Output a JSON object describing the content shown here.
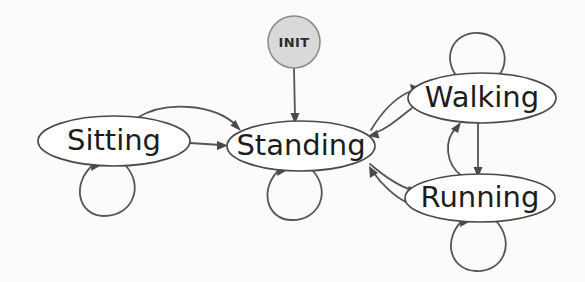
{
  "diagram": {
    "type": "state-machine-diagram",
    "canvas": {
      "width": 585,
      "height": 282
    },
    "colors": {
      "background": "#fbfbfa",
      "node_fill": "#ffffff",
      "node_stroke": "#4a4a4a",
      "init_fill": "#d9d9d9",
      "init_stroke": "#8a8a8a",
      "edge_stroke": "#555555",
      "label_text": "#1c1c1c"
    },
    "nodes": [
      {
        "id": "init",
        "label": "INIT",
        "shape": "circle",
        "filled": true,
        "cx": 294,
        "cy": 42,
        "rx": 26,
        "ry": 26
      },
      {
        "id": "sitting",
        "label": "Sitting",
        "shape": "ellipse",
        "filled": false,
        "cx": 114,
        "cy": 141,
        "rx": 76,
        "ry": 25
      },
      {
        "id": "standing",
        "label": "Standing",
        "shape": "ellipse",
        "filled": false,
        "cx": 301,
        "cy": 146,
        "rx": 74,
        "ry": 25
      },
      {
        "id": "walking",
        "label": "Walking",
        "shape": "ellipse",
        "filled": false,
        "cx": 482,
        "cy": 98,
        "rx": 74,
        "ry": 25
      },
      {
        "id": "running",
        "label": "Running",
        "shape": "ellipse",
        "filled": false,
        "cx": 480,
        "cy": 198,
        "rx": 75,
        "ry": 24
      }
    ],
    "edges": [
      {
        "id": "init-standing",
        "from": "init",
        "to": "standing",
        "style": "straight",
        "label": ""
      },
      {
        "id": "sitting-standing-arc",
        "from": "sitting",
        "to": "standing",
        "style": "curved",
        "label": ""
      },
      {
        "id": "sitting-standing-line",
        "from": "sitting",
        "to": "standing",
        "style": "straight",
        "label": ""
      },
      {
        "id": "standing-walking",
        "from": "standing",
        "to": "walking",
        "style": "curved",
        "label": ""
      },
      {
        "id": "walking-standing",
        "from": "walking",
        "to": "standing",
        "style": "curved",
        "label": ""
      },
      {
        "id": "standing-running",
        "from": "standing",
        "to": "running",
        "style": "curved",
        "label": ""
      },
      {
        "id": "running-standing",
        "from": "running",
        "to": "standing",
        "style": "curved",
        "label": ""
      },
      {
        "id": "walking-running",
        "from": "walking",
        "to": "running",
        "style": "straight",
        "label": ""
      },
      {
        "id": "running-walking",
        "from": "running",
        "to": "walking",
        "style": "curved",
        "label": ""
      },
      {
        "id": "sitting-self",
        "from": "sitting",
        "to": "sitting",
        "style": "self-loop",
        "position": "bottom",
        "label": ""
      },
      {
        "id": "standing-self",
        "from": "standing",
        "to": "standing",
        "style": "self-loop",
        "position": "bottom",
        "label": ""
      },
      {
        "id": "walking-self",
        "from": "walking",
        "to": "walking",
        "style": "self-loop",
        "position": "top",
        "label": ""
      },
      {
        "id": "running-self",
        "from": "running",
        "to": "running",
        "style": "self-loop",
        "position": "bottom",
        "label": ""
      }
    ]
  }
}
